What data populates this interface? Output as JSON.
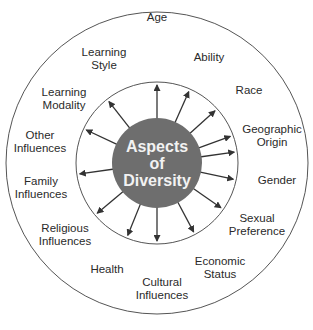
{
  "diagram": {
    "center_title": [
      "Aspects",
      "of",
      "Diversity"
    ],
    "colors": {
      "center_fill": "#6e6e6e",
      "center_text": "#f2f2f2",
      "lines": "#333333",
      "outer_ring": "#555555",
      "label_text": "#2a2a2a"
    },
    "aspects": [
      {
        "id": "age",
        "lines": [
          "Age"
        ],
        "x": 157,
        "y": 17
      },
      {
        "id": "ability",
        "lines": [
          "Ability"
        ],
        "x": 209,
        "y": 57
      },
      {
        "id": "race",
        "lines": [
          "Race"
        ],
        "x": 249,
        "y": 90
      },
      {
        "id": "geographic-origin",
        "lines": [
          "Geographic",
          "Origin"
        ],
        "x": 272,
        "y": 135
      },
      {
        "id": "gender",
        "lines": [
          "Gender"
        ],
        "x": 277,
        "y": 180
      },
      {
        "id": "sexual-preference",
        "lines": [
          "Sexual",
          "Preference"
        ],
        "x": 257,
        "y": 224
      },
      {
        "id": "economic-status",
        "lines": [
          "Economic",
          "Status"
        ],
        "x": 220,
        "y": 267
      },
      {
        "id": "cultural-influences",
        "lines": [
          "Cultural",
          "Influences"
        ],
        "x": 162,
        "y": 288
      },
      {
        "id": "health",
        "lines": [
          "Health"
        ],
        "x": 107,
        "y": 269
      },
      {
        "id": "religious-influences",
        "lines": [
          "Religious",
          "Influences"
        ],
        "x": 65,
        "y": 234
      },
      {
        "id": "family-influences",
        "lines": [
          "Family",
          "Influences"
        ],
        "x": 41,
        "y": 187
      },
      {
        "id": "other-influences",
        "lines": [
          "Other",
          "Influences"
        ],
        "x": 40,
        "y": 141
      },
      {
        "id": "learning-modality",
        "lines": [
          "Learning",
          "Modality"
        ],
        "x": 64,
        "y": 98
      },
      {
        "id": "learning-style",
        "lines": [
          "Learning",
          "Style"
        ],
        "x": 104,
        "y": 58
      }
    ],
    "geometry": {
      "cx": 157,
      "cy": 163,
      "outer_radius": 151,
      "inner_radius": 81,
      "center_radius": 45,
      "arrow_angles_deg": [
        -90,
        -66,
        -42,
        -20,
        -8,
        12,
        35,
        62,
        90,
        112,
        140,
        172,
        205,
        232
      ]
    }
  }
}
